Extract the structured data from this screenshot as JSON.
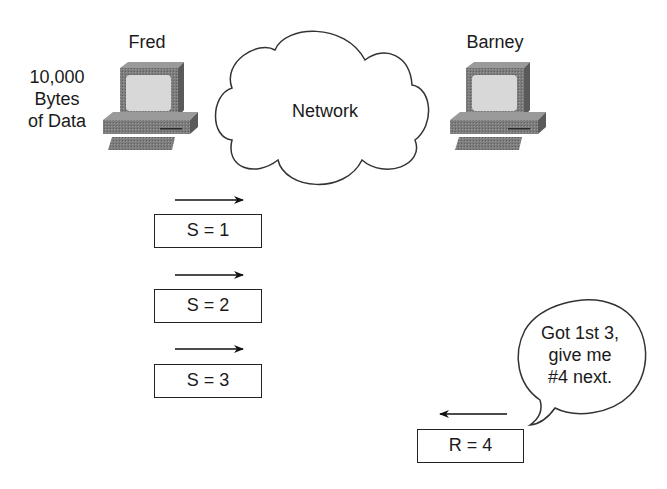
{
  "hosts": {
    "sender": {
      "name": "Fred",
      "data_note": [
        "10,000",
        "Bytes",
        "of Data"
      ]
    },
    "receiver": {
      "name": "Barney"
    }
  },
  "network": {
    "label": "Network"
  },
  "segments": [
    {
      "label": "S = 1",
      "direction": "right"
    },
    {
      "label": "S = 2",
      "direction": "right"
    },
    {
      "label": "S = 3",
      "direction": "right"
    }
  ],
  "ack": {
    "label": "R = 4",
    "direction": "left"
  },
  "speech_bubble": {
    "lines": [
      "Got 1st 3,",
      "give me",
      "#4 next."
    ]
  },
  "colors": {
    "line": "#222222",
    "computer_dark": "#6e6e6e",
    "computer_mid": "#8a8a8a",
    "screen": "#d6d6d6"
  }
}
